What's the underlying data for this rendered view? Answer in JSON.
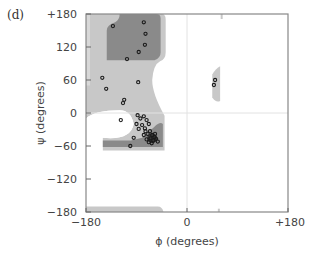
{
  "panel_label": "(d)",
  "chart_data": {
    "type": "scatter",
    "title": "",
    "subtitle": "Ramachandran plot",
    "xlabel": "ϕ (degrees)",
    "ylabel": "ψ (degrees)",
    "xlim": [
      -180,
      180
    ],
    "ylim": [
      -180,
      180
    ],
    "x_tick_labels": [
      "−180",
      "0",
      "+180"
    ],
    "x_ticks": [
      -180,
      0,
      180
    ],
    "y_tick_labels": [
      "+180",
      "120",
      "60",
      "0",
      "−60",
      "−120",
      "−180"
    ],
    "y_ticks": [
      180,
      120,
      60,
      0,
      -60,
      -120,
      -180
    ],
    "grid": false,
    "reference_lines": {
      "phi": 0,
      "psi": 0
    },
    "legend": null,
    "regions": [
      {
        "name": "allowed",
        "shade": "light gray",
        "color": "#c8c8c8"
      },
      {
        "name": "core",
        "shade": "dark gray",
        "color": "#8a8a8a"
      }
    ],
    "series": [
      {
        "name": "residues",
        "marker": "open circle",
        "points": [
          {
            "phi": -132,
            "psi": 158
          },
          {
            "phi": -77,
            "psi": 165
          },
          {
            "phi": -74,
            "psi": 144
          },
          {
            "phi": -75,
            "psi": 124
          },
          {
            "phi": -86,
            "psi": 111
          },
          {
            "phi": -107,
            "psi": 98
          },
          {
            "phi": -151,
            "psi": 64
          },
          {
            "phi": -144,
            "psi": 44
          },
          {
            "phi": -87,
            "psi": 56
          },
          {
            "phi": -112,
            "psi": 24
          },
          {
            "phi": -114,
            "psi": 18
          },
          {
            "phi": -118,
            "psi": -13
          },
          {
            "phi": -95,
            "psi": -45
          },
          {
            "phi": -101,
            "psi": -60
          },
          {
            "phi": -88,
            "psi": -4
          },
          {
            "phi": -83,
            "psi": -10
          },
          {
            "phi": -77,
            "psi": -6
          },
          {
            "phi": -72,
            "psi": -13
          },
          {
            "phi": -68,
            "psi": -20
          },
          {
            "phi": -80,
            "psi": -22
          },
          {
            "phi": -75,
            "psi": -28
          },
          {
            "phi": -86,
            "psi": -29
          },
          {
            "phi": -66,
            "psi": -33
          },
          {
            "phi": -70,
            "psi": -38
          },
          {
            "phi": -62,
            "psi": -40
          },
          {
            "phi": -77,
            "psi": -40
          },
          {
            "phi": -58,
            "psi": -44
          },
          {
            "phi": -65,
            "psi": -46
          },
          {
            "phi": -72,
            "psi": -48
          },
          {
            "phi": -60,
            "psi": -50
          },
          {
            "phi": -55,
            "psi": -47
          },
          {
            "phi": -68,
            "psi": -53
          },
          {
            "phi": -63,
            "psi": -55
          },
          {
            "phi": -57,
            "psi": -38
          },
          {
            "phi": -52,
            "psi": -52
          },
          {
            "phi": -74,
            "psi": -33
          },
          {
            "phi": -90,
            "psi": -20
          },
          {
            "phi": 48,
            "psi": 51
          },
          {
            "phi": 50,
            "psi": 60
          }
        ]
      }
    ]
  }
}
